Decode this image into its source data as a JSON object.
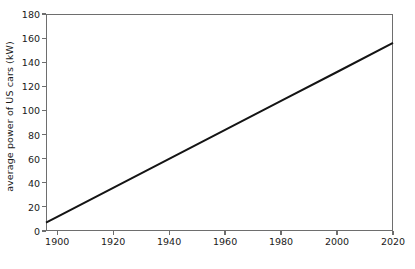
{
  "chart_data": {
    "type": "line",
    "title": "",
    "subtitle": "",
    "xlabel": "",
    "ylabel": "average power of US cars  (kW)",
    "xlim": [
      1896,
      2020
    ],
    "ylim": [
      0,
      180
    ],
    "xticks": [
      1900,
      1920,
      1940,
      1960,
      1980,
      2000,
      2020
    ],
    "yticks": [
      0,
      20,
      40,
      60,
      80,
      100,
      120,
      140,
      160,
      180
    ],
    "grid": false,
    "legend": null,
    "frame": "box",
    "line_color": "#141414",
    "axis_color": "#6e6e6e",
    "series": [
      {
        "name": "average power of US cars",
        "x": [
          1896,
          1900,
          1920,
          1940,
          1960,
          1980,
          2000,
          2020
        ],
        "values": [
          7,
          11.8,
          35.8,
          59.9,
          83.9,
          107.9,
          131.9,
          156
        ]
      }
    ],
    "annotations": []
  }
}
